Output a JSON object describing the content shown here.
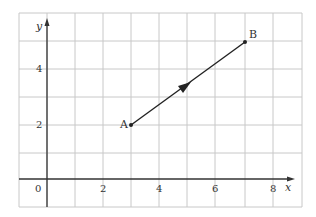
{
  "diagram": {
    "type": "coordinate-grid-vector",
    "axes": {
      "x_label": "x",
      "y_label": "y",
      "x_ticks": [
        "0",
        "2",
        "4",
        "6",
        "8"
      ],
      "y_ticks": [
        "2",
        "4"
      ]
    },
    "points": [
      {
        "label": "A",
        "x": 3,
        "y": 2
      },
      {
        "label": "B",
        "x": 7,
        "y": 5
      }
    ],
    "vector": {
      "from": "A",
      "to": "B",
      "arrow": "midpoint"
    },
    "colors": {
      "grid": "#c8c8c8",
      "axis": "#333333",
      "line": "#222222"
    }
  }
}
